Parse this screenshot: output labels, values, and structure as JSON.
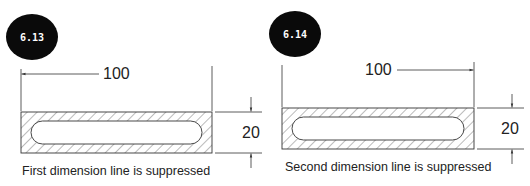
{
  "figures": [
    {
      "badge": "6.13",
      "width_dimension": "100",
      "height_dimension": "20",
      "caption": "First dimension line is suppressed",
      "suppressed_side": "left"
    },
    {
      "badge": "6.14",
      "width_dimension": "100",
      "height_dimension": "20",
      "caption": "Second dimension line is suppressed",
      "suppressed_side": "right"
    }
  ],
  "colors": {
    "badge_fill": "#0a0a0a",
    "line": "#333333",
    "hatch": "#555555",
    "text": "#222222"
  }
}
